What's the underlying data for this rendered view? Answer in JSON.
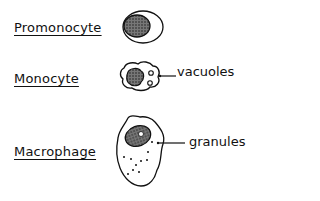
{
  "stages": [
    {
      "label": "Promonocyte"
    },
    {
      "label": "Monocyte",
      "annotation": "vacuoles"
    },
    {
      "label": "Macrophage",
      "annotation": "granules"
    }
  ],
  "colors": {
    "ink": "#111111",
    "nucleus_fill": "#555555",
    "background": "#ffffff"
  }
}
